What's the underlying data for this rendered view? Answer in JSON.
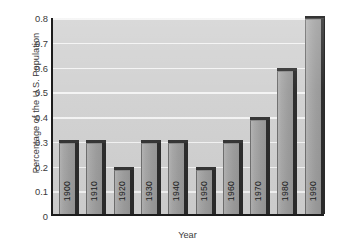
{
  "chart_data": {
    "type": "bar",
    "title": "",
    "xlabel": "Year",
    "ylabel": "Percentage of the U.S. Population",
    "categories": [
      "1900",
      "1910",
      "1920",
      "1930",
      "1940",
      "1950",
      "1960",
      "1970",
      "1980",
      "1990"
    ],
    "values": [
      0.3,
      0.3,
      0.19,
      0.3,
      0.3,
      0.19,
      0.3,
      0.39,
      0.59,
      0.8
    ],
    "ylim": [
      0,
      0.8
    ],
    "ytick_labels": [
      "0",
      "0.1",
      "0.2",
      "0.3",
      "0.4",
      "0.5",
      "0.6",
      "0.7",
      "0.8"
    ],
    "ytick_values": [
      0,
      0.1,
      0.2,
      0.3,
      0.4,
      0.5,
      0.6,
      0.7,
      0.8
    ],
    "grid": true,
    "grid_orientation": "horizontal",
    "legend": null,
    "series": [
      {
        "name": "Percentage of the U.S. Population",
        "values": [
          0.3,
          0.3,
          0.19,
          0.3,
          0.3,
          0.19,
          0.3,
          0.39,
          0.59,
          0.8
        ]
      }
    ],
    "colors": {
      "plot_background": "#d2d2d2",
      "gridline": "#f4f4f4",
      "bar_face": "#a9a9a9",
      "bar_shadow": "#2b2b2b",
      "axis": "#1c1c1c",
      "text": "#3a3a3a"
    }
  }
}
